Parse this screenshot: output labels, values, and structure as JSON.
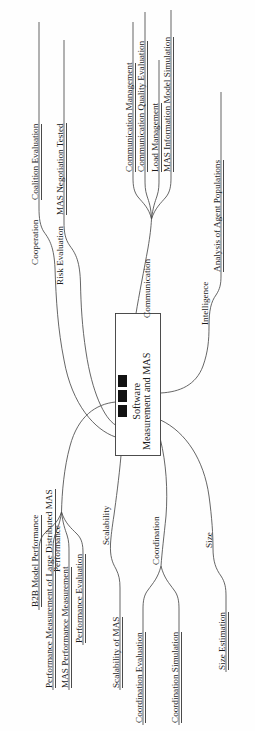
{
  "diagram": {
    "type": "mind-map",
    "orientation": "rotated-90-ccw",
    "center": {
      "line1": "Software",
      "line2": "Measurement and MAS",
      "bullet_count": 3
    },
    "branches": [
      {
        "id": "cooperation",
        "label": "Cooperation",
        "leaves": [
          {
            "label": "Coalition Evaluation"
          }
        ]
      },
      {
        "id": "risk-evaluation",
        "label": "Risk Evaluation",
        "leaves": [
          {
            "label": "MAS Negotiation Tested"
          }
        ]
      },
      {
        "id": "communication",
        "label": "Communication",
        "leaves": [
          {
            "label": "Communication Management"
          },
          {
            "label": "Communication Quality Evaluation"
          },
          {
            "label": "Load Management"
          },
          {
            "label": "MAS Information Model Simulation"
          }
        ]
      },
      {
        "id": "intelligence",
        "label": "Intelligence",
        "leaves": [
          {
            "label": "Analysis of Agent Populations"
          }
        ]
      },
      {
        "id": "performance",
        "label": "Performance",
        "leaves": [
          {
            "label": "B2B Model Performance"
          },
          {
            "label": "Performance Measurement of Large Distributed MAS"
          },
          {
            "label": "MAS Performance Measurement"
          },
          {
            "label": "Performance Evaluation"
          }
        ]
      },
      {
        "id": "scalability",
        "label": "Scalability",
        "leaves": [
          {
            "label": "Scalability of MAS"
          }
        ]
      },
      {
        "id": "coordination",
        "label": "Coordination",
        "leaves": [
          {
            "label": "Coordination Evaluation"
          },
          {
            "label": "Coordination Simulation"
          }
        ]
      },
      {
        "id": "size",
        "label": "Size",
        "leaves": [
          {
            "label": "Size Estimation"
          }
        ]
      }
    ],
    "colors": {
      "background": "#fefefe",
      "stroke": "#4a4a4a",
      "text": "#1b1b1b",
      "bullet": "#121212"
    }
  }
}
